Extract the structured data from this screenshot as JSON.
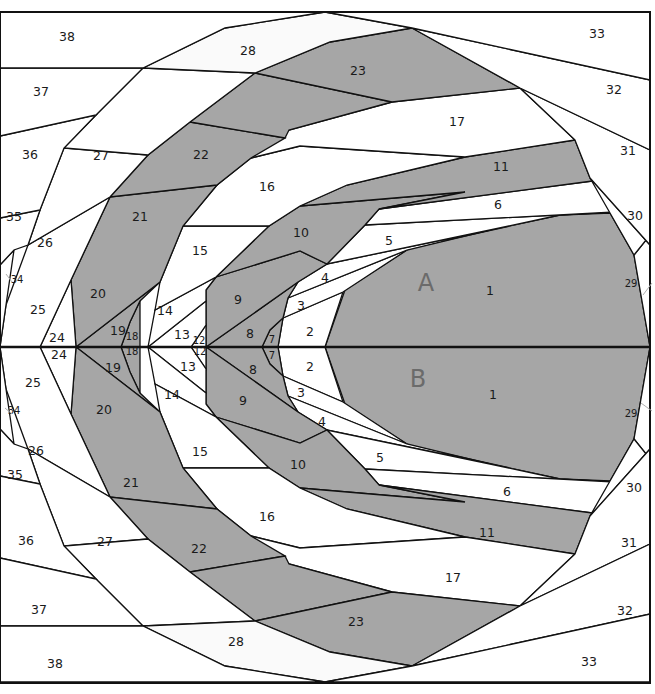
{
  "diagram": {
    "type": "foundation-paper-piecing-pattern",
    "colors": {
      "dark_fabric": "#a6a6a6",
      "light_fabric": "#ffffff",
      "line": "#111111",
      "section_letter": "#6b6b6b"
    },
    "sections": [
      {
        "letter": "A",
        "x": 426,
        "y": 284
      },
      {
        "letter": "B",
        "x": 418,
        "y": 380
      }
    ],
    "midline_y": 347,
    "frame": {
      "x": 0,
      "y": 12,
      "width": 650,
      "height": 671
    },
    "pieces_top": [
      {
        "n": "1",
        "fill": "dark",
        "points": "325,347 345,290 410,248 560,215 610,213 634,255 650,347"
      },
      {
        "n": "2",
        "fill": "light",
        "points": "278,347 283,318 343,292 325,347"
      },
      {
        "n": "3",
        "fill": "light",
        "points": "283,318 288,298 407,250 343,292"
      },
      {
        "n": "4",
        "fill": "light",
        "points": "288,298 298,282 327,264 490,230 407,250"
      },
      {
        "n": "5",
        "fill": "light",
        "points": "327,264 365,225 615,212 560,215 490,230"
      },
      {
        "n": "6",
        "fill": "light",
        "points": "365,225 379,209 600,180 617,212 615,212"
      },
      {
        "n": "7",
        "fill": "dark",
        "points": "262,347 270,330 283,318 278,347"
      },
      {
        "n": "8",
        "fill": "dark",
        "points": "206,347 298,282 288,298 283,318 270,330 262,347"
      },
      {
        "n": "9",
        "fill": "dark",
        "points": "206,347 206,290 216,277 300,251 327,264 298,282"
      },
      {
        "n": "10",
        "fill": "dark",
        "points": "216,277 269,226 300,206 465,192 379,209 365,225 327,264 300,251"
      },
      {
        "n": "11",
        "fill": "dark",
        "points": "300,206 347,185 465,157 575,140 590,178 600,180 379,209 465,192"
      },
      {
        "n": "12",
        "fill": "light",
        "points": "191,347 206,325 206,347"
      },
      {
        "n": "13",
        "fill": "light",
        "points": "148,347 206,301 206,325 191,347"
      },
      {
        "n": "14",
        "fill": "light",
        "points": "148,347 155,310 216,277 206,290 206,301"
      },
      {
        "n": "15",
        "fill": "light",
        "points": "155,310 160,282 183,226 269,226 216,277"
      },
      {
        "n": "16",
        "fill": "light",
        "points": "183,226 217,185 251,158 300,146 465,157 347,185 300,206 269,226"
      },
      {
        "n": "17",
        "fill": "light",
        "points": "251,158 289,130 392,102 520,88 575,140 465,157 300,146"
      },
      {
        "n": "18",
        "fill": "dark",
        "points": "121,347 130,322 140,301 140,347"
      },
      {
        "n": "19",
        "fill": "dark",
        "points": "76,347 160,282 140,301 130,322 121,347"
      },
      {
        "n": "20",
        "fill": "dark",
        "points": "76,347 71,280 110,197 217,185 183,226 160,282"
      },
      {
        "n": "21",
        "fill": "dark",
        "points": "110,197 148,155 190,122 285,138 251,158 217,185"
      },
      {
        "n": "22",
        "fill": "dark",
        "points": "190,122 255,73 392,102 289,130 285,138"
      },
      {
        "n": "23",
        "fill": "dark",
        "points": "255,73 330,42 412,28 520,88 392,102"
      },
      {
        "n": "24",
        "fill": "light",
        "points": "40,347 71,280 76,347"
      },
      {
        "n": "25",
        "fill": "light",
        "points": "0,347 6,305 28,245 110,197 71,280 40,347"
      },
      {
        "n": "26",
        "fill": "light",
        "points": "28,245 40,210 64,148 148,155 110,197"
      },
      {
        "n": "27",
        "fill": "light",
        "points": "64,148 96,115 143,68 255,73 190,122 148,155"
      },
      {
        "n": "28",
        "fill": "pale",
        "points": "143,68 225,28 325,12 412,28 330,42 255,73"
      },
      {
        "n": "29",
        "fill": "light",
        "points": "634,255 650,235 650,347"
      },
      {
        "n": "30",
        "fill": "light",
        "points": "610,213 590,178 650,245 650,235 634,255"
      },
      {
        "n": "31",
        "fill": "light",
        "points": "575,140 520,88 650,150 650,245 590,178"
      },
      {
        "n": "32",
        "fill": "light",
        "points": "520,88 412,28 650,80 650,150"
      },
      {
        "n": "33",
        "fill": "light",
        "points": "412,28 325,12 650,12 650,80"
      },
      {
        "n": "34",
        "fill": "light",
        "points": "0,347 0,265 14,250 6,305"
      },
      {
        "n": "35",
        "fill": "light",
        "points": "0,265 0,218 40,210 28,245 14,250"
      },
      {
        "n": "36",
        "fill": "light",
        "points": "0,218 0,136 96,115 64,148 40,210"
      },
      {
        "n": "37",
        "fill": "light",
        "points": "0,136 0,68 143,68 96,115"
      },
      {
        "n": "38",
        "fill": "light",
        "points": "0,68 0,12 325,12 225,28 143,68"
      }
    ],
    "labels_top": [
      {
        "t": "1",
        "x": 490,
        "y": 291
      },
      {
        "t": "2",
        "x": 310,
        "y": 332
      },
      {
        "t": "3",
        "x": 301,
        "y": 306
      },
      {
        "t": "4",
        "x": 325,
        "y": 278
      },
      {
        "t": "5",
        "x": 389,
        "y": 241
      },
      {
        "t": "6",
        "x": 498,
        "y": 205
      },
      {
        "t": "7",
        "x": 272,
        "y": 340,
        "small": true
      },
      {
        "t": "8",
        "x": 250,
        "y": 334
      },
      {
        "t": "9",
        "x": 238,
        "y": 300
      },
      {
        "t": "10",
        "x": 301,
        "y": 233
      },
      {
        "t": "11",
        "x": 501,
        "y": 167
      },
      {
        "t": "12",
        "x": 199,
        "y": 341,
        "small": true
      },
      {
        "t": "13",
        "x": 182,
        "y": 335
      },
      {
        "t": "14",
        "x": 165,
        "y": 311
      },
      {
        "t": "15",
        "x": 200,
        "y": 251
      },
      {
        "t": "16",
        "x": 267,
        "y": 187
      },
      {
        "t": "17",
        "x": 457,
        "y": 122
      },
      {
        "t": "18",
        "x": 132,
        "y": 337,
        "small": true
      },
      {
        "t": "19",
        "x": 118,
        "y": 331
      },
      {
        "t": "20",
        "x": 98,
        "y": 294
      },
      {
        "t": "21",
        "x": 140,
        "y": 217
      },
      {
        "t": "22",
        "x": 201,
        "y": 155
      },
      {
        "t": "23",
        "x": 358,
        "y": 71
      },
      {
        "t": "24",
        "x": 57,
        "y": 338
      },
      {
        "t": "25",
        "x": 38,
        "y": 310
      },
      {
        "t": "26",
        "x": 45,
        "y": 243
      },
      {
        "t": "27",
        "x": 101,
        "y": 156
      },
      {
        "t": "28",
        "x": 248,
        "y": 51
      },
      {
        "t": "29",
        "x": 631,
        "y": 284,
        "small": true
      },
      {
        "t": "30",
        "x": 635,
        "y": 216
      },
      {
        "t": "31",
        "x": 628,
        "y": 151
      },
      {
        "t": "32",
        "x": 614,
        "y": 90
      },
      {
        "t": "33",
        "x": 597,
        "y": 34
      },
      {
        "t": "34",
        "x": 17,
        "y": 280,
        "small": true
      },
      {
        "t": "35",
        "x": 14,
        "y": 217
      },
      {
        "t": "36",
        "x": 30,
        "y": 155
      },
      {
        "t": "37",
        "x": 41,
        "y": 92
      },
      {
        "t": "38",
        "x": 67,
        "y": 37
      }
    ],
    "labels_bottom": [
      {
        "t": "1",
        "x": 493,
        "y": 395
      },
      {
        "t": "2",
        "x": 310,
        "y": 367
      },
      {
        "t": "3",
        "x": 301,
        "y": 393
      },
      {
        "t": "4",
        "x": 322,
        "y": 422
      },
      {
        "t": "5",
        "x": 380,
        "y": 458
      },
      {
        "t": "6",
        "x": 507,
        "y": 492
      },
      {
        "t": "7",
        "x": 272,
        "y": 356,
        "small": true
      },
      {
        "t": "8",
        "x": 253,
        "y": 370
      },
      {
        "t": "9",
        "x": 243,
        "y": 401
      },
      {
        "t": "10",
        "x": 298,
        "y": 465
      },
      {
        "t": "11",
        "x": 487,
        "y": 533
      },
      {
        "t": "12",
        "x": 200,
        "y": 352,
        "small": true
      },
      {
        "t": "13",
        "x": 188,
        "y": 367
      },
      {
        "t": "14",
        "x": 172,
        "y": 395
      },
      {
        "t": "15",
        "x": 200,
        "y": 452
      },
      {
        "t": "16",
        "x": 267,
        "y": 517
      },
      {
        "t": "17",
        "x": 453,
        "y": 578
      },
      {
        "t": "18",
        "x": 132,
        "y": 352,
        "small": true
      },
      {
        "t": "19",
        "x": 113,
        "y": 368
      },
      {
        "t": "20",
        "x": 104,
        "y": 410
      },
      {
        "t": "21",
        "x": 131,
        "y": 483
      },
      {
        "t": "22",
        "x": 199,
        "y": 549
      },
      {
        "t": "23",
        "x": 356,
        "y": 622
      },
      {
        "t": "24",
        "x": 59,
        "y": 355
      },
      {
        "t": "25",
        "x": 33,
        "y": 383
      },
      {
        "t": "26",
        "x": 36,
        "y": 451
      },
      {
        "t": "27",
        "x": 105,
        "y": 542
      },
      {
        "t": "28",
        "x": 236,
        "y": 642
      },
      {
        "t": "29",
        "x": 631,
        "y": 414,
        "small": true
      },
      {
        "t": "30",
        "x": 634,
        "y": 488
      },
      {
        "t": "31",
        "x": 629,
        "y": 543
      },
      {
        "t": "32",
        "x": 625,
        "y": 611
      },
      {
        "t": "33",
        "x": 589,
        "y": 662
      },
      {
        "t": "34",
        "x": 14,
        "y": 411,
        "small": true
      },
      {
        "t": "35",
        "x": 15,
        "y": 475
      },
      {
        "t": "36",
        "x": 26,
        "y": 541
      },
      {
        "t": "37",
        "x": 39,
        "y": 610
      },
      {
        "t": "38",
        "x": 55,
        "y": 664
      }
    ]
  }
}
